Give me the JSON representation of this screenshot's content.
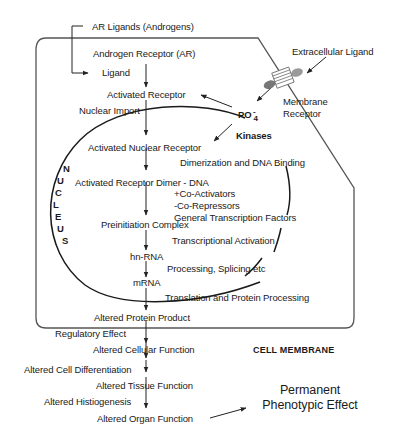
{
  "diagram": {
    "membrane_label": "CELL MEMBRANE",
    "nucleus_letters": [
      "N",
      "U",
      "C",
      "L",
      "E",
      "U",
      "S"
    ],
    "extracellular": {
      "ar_ligands": "AR Ligands (Androgens)",
      "extracellular_ligand": "Extracellular Ligand",
      "membrane_receptor_line1": "Membrane",
      "membrane_receptor_line2": "Receptor"
    },
    "cytoplasm": {
      "androgen_receptor": "Androgen Receptor (AR)",
      "ligand": "Ligand",
      "activated_receptor": "Activated Receptor",
      "nuclear_import": "Nuclear Import",
      "po4": "PO",
      "po4_sub": "4",
      "po4_sup": "-",
      "kinases": "Kinases",
      "translation": "Translation and Protein Processing",
      "altered_protein": "Altered Protein Product",
      "regulatory_effect": "Regulatory Effect",
      "altered_cellular": "Altered Cellular Function"
    },
    "nucleus": {
      "activated_nuclear_receptor": "Activated Nuclear Receptor",
      "dimerization": "Dimerization and DNA Binding",
      "receptor_dimer": "Activated Receptor Dimer - DNA",
      "co_activators": "+Co-Activators",
      "co_repressors": "-Co-Repressors",
      "gtf": "General Transcription Factors",
      "preinitiation": "Preinitiation Complex",
      "transcriptional_activation": "Transcriptional Activation",
      "hnrna": "hn-RNA",
      "processing": "Processing, Splicing etc",
      "mrna": "mRNA"
    },
    "outcomes": {
      "cell_differentiation": "Altered Cell Differentiation",
      "tissue_function": "Altered Tissue Function",
      "histiogenesis": "Altered Histiogenesis",
      "organ_function": "Altered Organ Function",
      "permanent_line1": "Permanent",
      "permanent_line2": "Phenotypic Effect"
    }
  }
}
